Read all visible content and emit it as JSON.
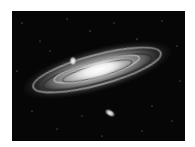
{
  "image": {
    "subject": "Andromeda galaxy (spiral galaxy) with two companion galaxies",
    "style": "grayscale astronomical photograph",
    "colors": {
      "background": "#ffffff",
      "sky": "#060606",
      "core": "#ffffff",
      "disk": "#bdbdbd",
      "dust_lane": "#2a2a2a"
    },
    "elements": {
      "main_galaxy": {
        "center": [
          97,
          70
        ],
        "tilt_deg": -15
      },
      "companion_upper": {
        "center": [
          73,
          61
        ]
      },
      "companion_lower": {
        "center": [
          110,
          113
        ],
        "tilt_deg": 30
      }
    }
  }
}
